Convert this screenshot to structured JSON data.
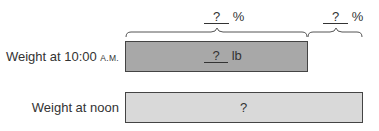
{
  "diagram": {
    "type": "percent bar model",
    "rows": [
      {
        "label_main": "Weight at 10:00 ",
        "label_suffix": "A.M.",
        "bar_text_blank": "?",
        "bar_text_unit": "lb",
        "fill": "#a8a8a8"
      },
      {
        "label_main": "Weight at noon",
        "bar_text": "?",
        "fill": "#d9d9d9"
      }
    ],
    "braces": [
      {
        "blank": "?",
        "unit": "%",
        "spans": "10:00 A.M. bar"
      },
      {
        "blank": "?",
        "unit": "%",
        "spans": "extension to noon bar"
      }
    ]
  }
}
